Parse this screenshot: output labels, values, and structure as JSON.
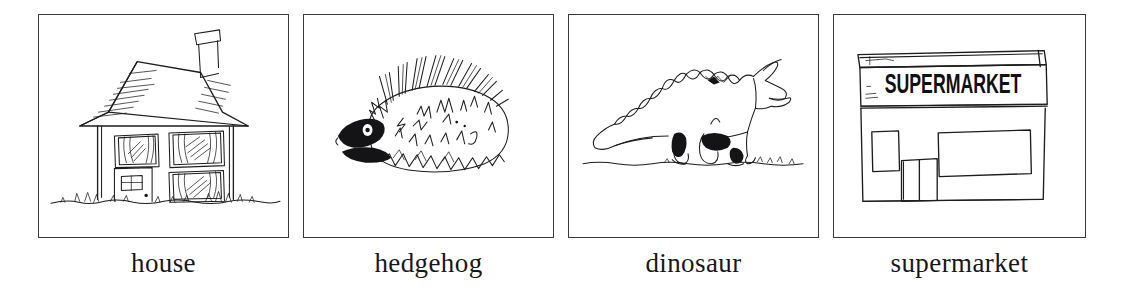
{
  "page": {
    "background_color": "#ffffff",
    "ink_color": "#1d1d1f",
    "frame_color": "#3a3a3a",
    "caption_color": "#17171a",
    "card_count": 4
  },
  "cards": [
    {
      "id": "house",
      "caption": "house",
      "drawing_name": "house-sketch",
      "drawing_description": "hand-drawn two-storey house with shingled roof, chimney, three curtained windows, front door and grass"
    },
    {
      "id": "hedgehog",
      "caption": "hedgehog",
      "drawing_name": "hedgehog-sketch",
      "drawing_description": "hand-drawn hedgehog facing left with dark inked snout and dense spines"
    },
    {
      "id": "dinosaur",
      "caption": "dinosaur",
      "drawing_name": "dinosaur-sketch",
      "drawing_description": "hand-drawn horned dinosaur with spiked back and long tail standing on ground line"
    },
    {
      "id": "supermarket",
      "caption": "supermarket",
      "drawing_name": "supermarket-sketch",
      "drawing_description": "hand-drawn shop front with fascia board, large display windows and double doors",
      "sign_text": "SUPERMARKET"
    }
  ]
}
